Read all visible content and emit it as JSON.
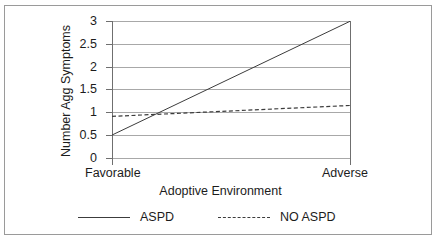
{
  "chart_data": {
    "type": "line",
    "title": "",
    "xlabel": "Adoptive Environment",
    "ylabel": "Number Agg Symptoms",
    "categories": [
      "Favorable",
      "Adverse"
    ],
    "x": [
      0,
      1
    ],
    "xlim": [
      0,
      1
    ],
    "ylim": [
      0,
      3
    ],
    "yticks": [
      "0",
      "0.5",
      "1",
      "1.5",
      "2",
      "2.5",
      "3"
    ],
    "ytick_values": [
      0,
      0.5,
      1,
      1.5,
      2,
      2.5,
      3
    ],
    "grid": true,
    "legend_position": "bottom",
    "series": [
      {
        "name": "ASPD",
        "style": "solid",
        "color": "#3c3c3c",
        "values": [
          0.5,
          3.0
        ]
      },
      {
        "name": "NO ASPD",
        "style": "dashed",
        "color": "#3c3c3c",
        "values": [
          0.91,
          1.15
        ]
      }
    ]
  },
  "axes": {
    "ytick_labels": [
      "3",
      "2.5",
      "2",
      "1.5",
      "1",
      "0.5",
      "0"
    ],
    "xtick_labels": [
      "Favorable",
      "Adverse"
    ],
    "x_axis_title": "Adoptive Environment",
    "y_axis_title": "Number Agg Symptoms"
  },
  "legend": {
    "entries": [
      {
        "label": "ASPD",
        "style": "solid"
      },
      {
        "label": "NO ASPD",
        "style": "dashed"
      }
    ]
  },
  "colors": {
    "line": "#3c3c3c",
    "grid": "#a8a8a8",
    "axis": "#6f6f6f",
    "frame": "#9a9a9a",
    "text": "#1c1c1c",
    "background": "#ffffff"
  }
}
